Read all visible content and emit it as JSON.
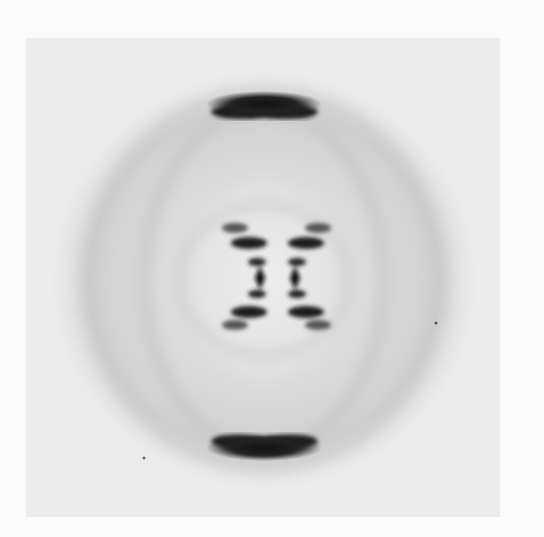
{
  "image": {
    "subject": "X-ray fiber diffraction photograph (helical cross pattern)",
    "colors": {
      "page": "#fbfbfb",
      "plate": "#e9e9e9",
      "halo": "#d2d2d2",
      "spot": "#141414"
    }
  }
}
